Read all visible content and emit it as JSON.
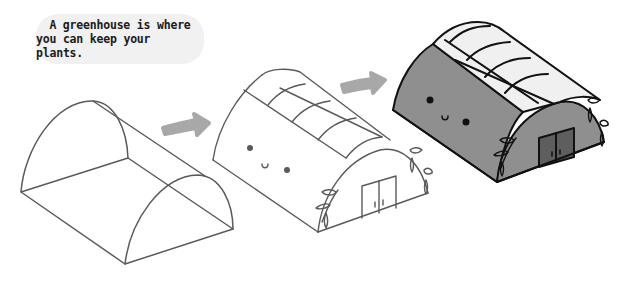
{
  "caption": {
    "line1": "A greenhouse is where",
    "line2": "you can keep your plants."
  },
  "steps": [
    {
      "index": 1,
      "description": "basic outline: two semicircular arches connected by a rectangular base"
    },
    {
      "index": 2,
      "description": "outline with roof panels, face, vines and double doors"
    },
    {
      "index": 3,
      "description": "colored final greenhouse with glass roof panels"
    }
  ],
  "icons": [
    "arrow-right-icon",
    "arrow-right-icon"
  ],
  "colors": {
    "background": "#ffffff",
    "bubble": "#f1f1f1",
    "stroke_light": "#5a5a5a",
    "stroke_dark": "#111111",
    "arrow": "#a8a8a8",
    "wall_fill": "#8f8f8f",
    "roof_glass": "#f0f0f0",
    "door_fill": "#5e5e5e"
  }
}
